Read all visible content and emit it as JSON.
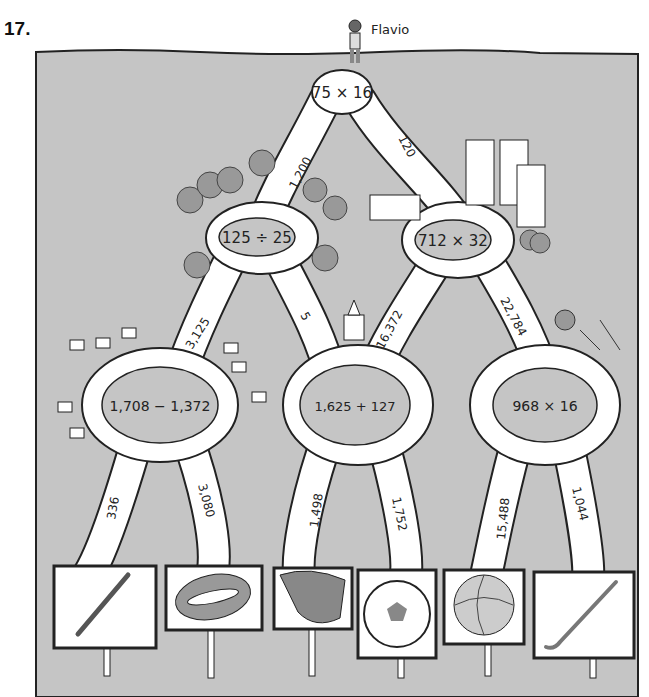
{
  "problem": {
    "number": "17."
  },
  "start": {
    "name": "Flavio"
  },
  "colors": {
    "ground": "#c5c5c5",
    "road": "#ffffff",
    "outline": "#222222",
    "island": "#c5c5c5"
  },
  "nodes": [
    {
      "id": "top",
      "expr": "75 × 16"
    },
    {
      "id": "mid_left",
      "expr": "125 ÷ 25"
    },
    {
      "id": "mid_right",
      "expr": "712 × 32"
    },
    {
      "id": "low_left",
      "expr": "1,708 − 1,372"
    },
    {
      "id": "low_center",
      "expr": "1,625 + 127"
    },
    {
      "id": "low_right",
      "expr": "968 × 16"
    }
  ],
  "paths": [
    {
      "from": "top",
      "to": "mid_left",
      "label": "1,200"
    },
    {
      "from": "top",
      "to": "mid_right",
      "label": "120"
    },
    {
      "from": "mid_left",
      "to": "low_left",
      "label": "3,125"
    },
    {
      "from": "mid_left",
      "to": "low_center",
      "label": "5"
    },
    {
      "from": "mid_right",
      "to": "low_center",
      "label": "16,372"
    },
    {
      "from": "mid_right",
      "to": "low_right",
      "label": "22,784"
    },
    {
      "from": "low_left",
      "to": "sign_1",
      "label": "336"
    },
    {
      "from": "low_left",
      "to": "sign_2",
      "label": "3,080"
    },
    {
      "from": "low_center",
      "to": "sign_3",
      "label": "1,498"
    },
    {
      "from": "low_center",
      "to": "sign_4",
      "label": "1,752"
    },
    {
      "from": "low_right",
      "to": "sign_5",
      "label": "15,488"
    },
    {
      "from": "low_right",
      "to": "sign_6",
      "label": "1,044"
    }
  ],
  "signs": [
    {
      "id": "sign_1",
      "icon": "baseball-bat-icon"
    },
    {
      "id": "sign_2",
      "icon": "football-icon"
    },
    {
      "id": "sign_3",
      "icon": "baseball-glove-icon"
    },
    {
      "id": "sign_4",
      "icon": "soccer-ball-icon"
    },
    {
      "id": "sign_5",
      "icon": "basketball-icon"
    },
    {
      "id": "sign_6",
      "icon": "hockey-stick-icon"
    }
  ]
}
